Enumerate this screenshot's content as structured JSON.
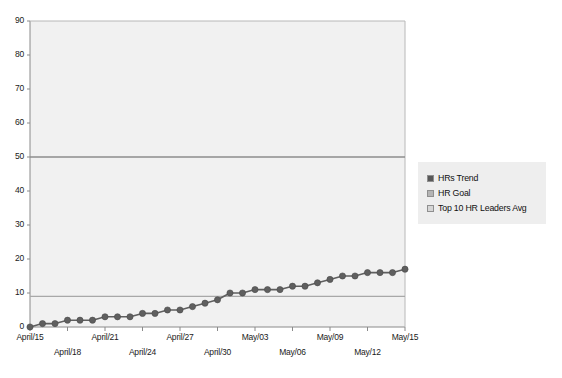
{
  "chart_data": {
    "type": "line",
    "title": "",
    "xlabel": "",
    "ylabel": "",
    "ylim": [
      0,
      90
    ],
    "y_ticks": [
      0,
      10,
      20,
      30,
      40,
      50,
      60,
      70,
      80,
      90
    ],
    "grid": false,
    "legend_position": "right",
    "x": [
      "April/15",
      "April/16",
      "April/17",
      "April/18",
      "April/19",
      "April/20",
      "April/21",
      "April/22",
      "April/23",
      "April/24",
      "April/25",
      "April/26",
      "April/27",
      "April/28",
      "April/29",
      "April/30",
      "May/01",
      "May/02",
      "May/03",
      "May/04",
      "May/05",
      "May/06",
      "May/07",
      "May/08",
      "May/09",
      "May/10",
      "May/11",
      "May/12",
      "May/13",
      "May/14",
      "May/15"
    ],
    "x_tick_labels": [
      "April/15",
      "April/18",
      "April/21",
      "April/24",
      "April/27",
      "April/30",
      "May/03",
      "May/06",
      "May/09",
      "May/12",
      "May/15"
    ],
    "x_tick_rows": [
      0,
      1,
      0,
      1,
      0,
      1,
      0,
      1,
      0,
      1,
      0
    ],
    "series": [
      {
        "name": "HRs Trend",
        "type": "line-markers",
        "color": "#5f5f5f",
        "marker": "circle",
        "values": [
          0,
          1,
          1,
          2,
          2,
          2,
          3,
          3,
          3,
          4,
          4,
          5,
          5,
          6,
          7,
          8,
          10,
          10,
          11,
          11,
          11,
          12,
          12,
          13,
          14,
          15,
          15,
          16,
          16,
          16,
          17
        ]
      },
      {
        "name": "HR Goal",
        "type": "constant-line",
        "color": "#8c8c8c",
        "value": 50
      },
      {
        "name": "Top 10 HR Leaders Avg",
        "type": "constant-line",
        "color": "#a8a8a8",
        "value": 9
      }
    ],
    "legend": [
      {
        "label": "HRs Trend",
        "swatch": "#585858"
      },
      {
        "label": "HR Goal",
        "swatch": "#b4b4b4"
      },
      {
        "label": "Top 10 HR Leaders Avg",
        "swatch": "#d6d6d6"
      }
    ]
  },
  "style": {
    "plot_background": "#f1f1f1",
    "figure_background": "#ffffff",
    "axis_color": "#8a8a8a",
    "legend_background": "#eeeeee",
    "tick_text_color": "#1a1a1a"
  }
}
